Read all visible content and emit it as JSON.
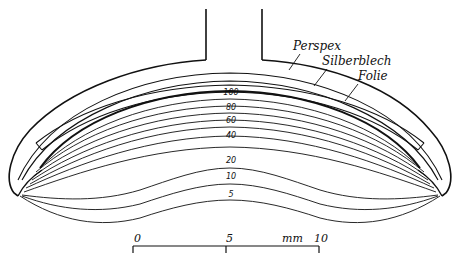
{
  "diagram": {
    "type": "cross-section",
    "labels": {
      "perspex": "Perspex",
      "silberblech": "Silberblech",
      "folie": "Folie"
    },
    "isodose_labels": [
      "100",
      "80",
      "60",
      "40",
      "20",
      "10",
      "5"
    ],
    "scale_bar": {
      "start": "0",
      "mid": "5",
      "end": "10",
      "unit": "mm"
    },
    "colors": {
      "line": "#111111",
      "background": "#ffffff"
    }
  }
}
